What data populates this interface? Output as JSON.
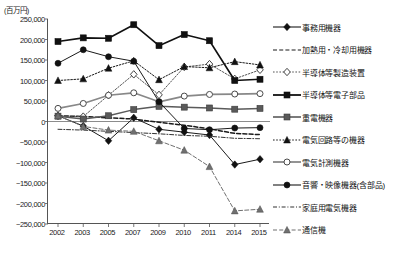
{
  "chart_data": {
    "type": "line",
    "title": "",
    "xlabel": "",
    "ylabel": "",
    "unit_label": "(百万円)",
    "ylim": [
      -250000,
      250000
    ],
    "grid": false,
    "legend_position": "right",
    "categories": [
      "2002",
      "2003",
      "2005",
      "2007",
      "2009",
      "2010",
      "2011",
      "2014",
      "2015"
    ],
    "yticks": [
      "250,000",
      "200,000",
      "150,000",
      "100,000",
      "50,000",
      "0",
      "-50,000",
      "-100,000",
      "-150,000",
      "-200,000",
      "-250,000"
    ],
    "ytick_values": [
      250000,
      200000,
      150000,
      100000,
      50000,
      0,
      -50000,
      -100000,
      -150000,
      -200000,
      -250000
    ],
    "series": [
      {
        "name": "事務用機器",
        "marker": "diamond-filled",
        "color": "#1a1a1a",
        "line": "solid",
        "values": [
          14000,
          -11000,
          -47000,
          9000,
          -19000,
          -26000,
          -33000,
          -105000,
          -92000
        ]
      },
      {
        "name": "加熱用・冷却用機器",
        "marker": "none",
        "color": "#1a1a1a",
        "line": "dashed",
        "values": [
          14000,
          12000,
          9000,
          6000,
          -2000,
          -9000,
          -18000,
          -29000,
          -32000
        ]
      },
      {
        "name": "半導体等製造装置",
        "marker": "diamond-open",
        "color": "#555555",
        "line": "dotted",
        "values": [
          14000,
          12000,
          64000,
          115000,
          65000,
          133000,
          140000,
          104000,
          126000
        ]
      },
      {
        "name": "半導体等電子部品",
        "marker": "square-filled",
        "color": "#111111",
        "line": "solid",
        "values": [
          195000,
          204000,
          203000,
          236000,
          185000,
          212000,
          197000,
          100000,
          103000
        ]
      },
      {
        "name": "重電機器",
        "marker": "square-grey",
        "color": "#5a5a5a",
        "line": "solid",
        "values": [
          13000,
          6000,
          14000,
          29000,
          37000,
          35000,
          33000,
          30000,
          32000
        ]
      },
      {
        "name": "電気回路等の機器",
        "marker": "triangle-filled",
        "color": "#1a1a1a",
        "line": "dotted",
        "values": [
          100000,
          104000,
          130000,
          148000,
          102000,
          134000,
          131000,
          146000,
          138000
        ]
      },
      {
        "name": "電気計測機器",
        "marker": "circle-open",
        "color": "#888888",
        "line": "solid",
        "values": [
          32000,
          44000,
          64000,
          70000,
          48000,
          62000,
          66000,
          67000,
          68000
        ]
      },
      {
        "name": "音響・映像機器(含部品)",
        "marker": "circle-filled",
        "color": "#1a1a1a",
        "line": "solid",
        "values": [
          142000,
          175000,
          158000,
          147000,
          48000,
          -17000,
          -20000,
          -16000,
          -15000
        ]
      },
      {
        "name": "家庭用電気機器",
        "marker": "none",
        "color": "#333333",
        "line": "dashdot",
        "values": [
          -19000,
          -21000,
          -24000,
          -27000,
          -30000,
          -34000,
          -36000,
          -41000,
          -42000
        ]
      },
      {
        "name": "通信機",
        "marker": "triangle-grey",
        "color": "#707070",
        "line": "dashed",
        "values": [
          14000,
          -12000,
          -21000,
          -24000,
          -47000,
          -70000,
          -110000,
          -218000,
          -214000
        ]
      }
    ]
  }
}
